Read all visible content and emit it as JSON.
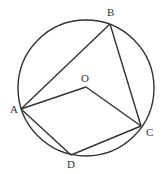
{
  "diagram": {
    "type": "circle-geometry",
    "circle": {
      "cx": 86,
      "cy": 88,
      "r": 68,
      "center_label": "O"
    },
    "points": {
      "A": {
        "x": 21,
        "y": 109,
        "label": "A",
        "label_x": 10,
        "label_y": 113
      },
      "B": {
        "x": 110,
        "y": 24,
        "label": "B",
        "label_x": 107,
        "label_y": 16
      },
      "C": {
        "x": 141,
        "y": 126,
        "label": "C",
        "label_x": 146,
        "label_y": 136
      },
      "D": {
        "x": 71,
        "y": 155,
        "label": "D",
        "label_x": 67,
        "label_y": 168
      },
      "O": {
        "x": 86,
        "y": 87,
        "label": "O",
        "label_x": 81,
        "label_y": 82
      }
    },
    "segments": [
      "AB",
      "BC",
      "AO",
      "OC",
      "AD",
      "DC"
    ],
    "stroke_color": "#333333"
  }
}
